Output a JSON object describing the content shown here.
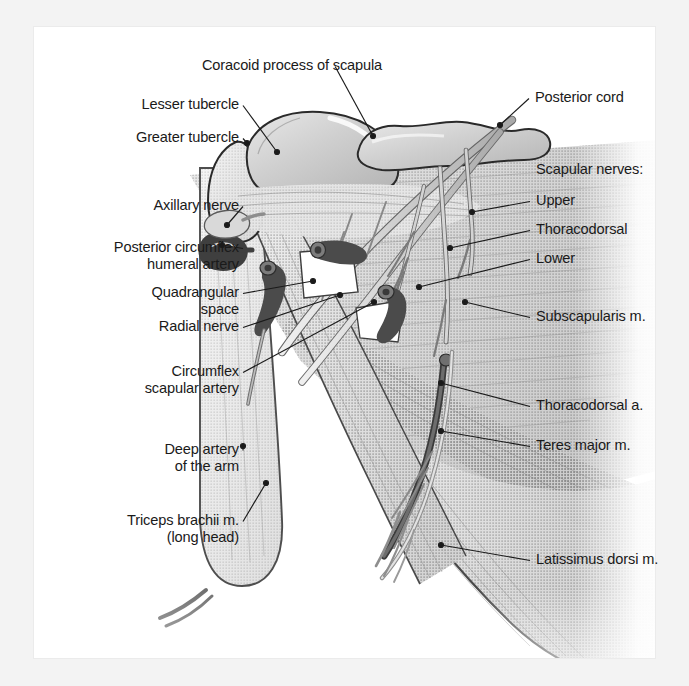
{
  "figure": {
    "background_color": "#f3f3f3",
    "page_color": "#ffffff",
    "ink_color": "#1a1a1a",
    "style": "grayscale halftone medical illustration"
  },
  "labels": [
    {
      "id": "coracoid-process",
      "text": "Coracoid process of scapula",
      "align": "c",
      "x": 194,
      "y": 57,
      "w": 196,
      "anchor_x": 373,
      "anchor_y": 136
    },
    {
      "id": "posterior-cord",
      "text": "Posterior cord",
      "align": "r",
      "x": 535,
      "y": 89,
      "w": 130,
      "anchor_x": 500,
      "anchor_y": 125
    },
    {
      "id": "lesser-tubercle",
      "text": "Lesser tubercle",
      "align": "l",
      "x": 125,
      "y": 96,
      "w": 114,
      "anchor_x": 277,
      "anchor_y": 152
    },
    {
      "id": "greater-tubercle",
      "text": "Greater tubercle",
      "align": "l",
      "x": 93,
      "y": 129,
      "w": 146,
      "anchor_x": 247,
      "anchor_y": 143
    },
    {
      "id": "scapular-nerves-heading",
      "text": "Scapular nerves:",
      "align": "r",
      "x": 536,
      "y": 161,
      "w": 140,
      "anchor_x": null,
      "anchor_y": null
    },
    {
      "id": "scapular-nerve-upper",
      "text": "Upper",
      "align": "r",
      "x": 536,
      "y": 192,
      "w": 70,
      "anchor_x": 472,
      "anchor_y": 212
    },
    {
      "id": "axillary-nerve",
      "text": "Axillary nerve",
      "align": "l",
      "x": 113,
      "y": 197,
      "w": 126,
      "anchor_x": 227,
      "anchor_y": 225
    },
    {
      "id": "thoracodorsal-nerve",
      "text": "Thoracodorsal",
      "align": "r",
      "x": 536,
      "y": 221,
      "w": 124,
      "anchor_x": 450,
      "anchor_y": 248
    },
    {
      "id": "posterior-circumflex",
      "text": "Posterior circumflex\nhumeral artery",
      "align": "l",
      "x": 51,
      "y": 239,
      "w": 188,
      "anchor_x": 222,
      "anchor_y": 245
    },
    {
      "id": "scapular-nerve-lower",
      "text": "Lower",
      "align": "r",
      "x": 536,
      "y": 250,
      "w": 70,
      "anchor_x": 419,
      "anchor_y": 287
    },
    {
      "id": "quadrangular-space",
      "text": "Quadrangular\nspace",
      "align": "l",
      "x": 79,
      "y": 284,
      "w": 160,
      "anchor_x": 313,
      "anchor_y": 281
    },
    {
      "id": "subscapularis-muscle",
      "text": "Subscapularis m.",
      "align": "r",
      "x": 536,
      "y": 308,
      "w": 150,
      "anchor_x": 465,
      "anchor_y": 302
    },
    {
      "id": "radial-nerve",
      "text": "Radial nerve",
      "align": "l",
      "x": 113,
      "y": 318,
      "w": 126,
      "anchor_x": 340,
      "anchor_y": 295
    },
    {
      "id": "circumflex-scapular",
      "text": "Circumflex\nscapular artery",
      "align": "l",
      "x": 79,
      "y": 363,
      "w": 160,
      "anchor_x": 374,
      "anchor_y": 302
    },
    {
      "id": "thoracodorsal-artery",
      "text": "Thoracodorsal a.",
      "align": "r",
      "x": 536,
      "y": 397,
      "w": 150,
      "anchor_x": 441,
      "anchor_y": 383
    },
    {
      "id": "teres-major-muscle",
      "text": "Teres major m.",
      "align": "r",
      "x": 536,
      "y": 437,
      "w": 140,
      "anchor_x": 441,
      "anchor_y": 431
    },
    {
      "id": "deep-artery-of-arm",
      "text": "Deep artery\nof the arm",
      "align": "l",
      "x": 79,
      "y": 441,
      "w": 160,
      "anchor_x": 243,
      "anchor_y": 446
    },
    {
      "id": "triceps-brachii-long-head",
      "text": "Triceps brachii m.\n(long head)",
      "align": "l",
      "x": 51,
      "y": 512,
      "w": 188,
      "anchor_x": 266,
      "anchor_y": 483
    },
    {
      "id": "latissimus-dorsi-muscle",
      "text": "Latissimus dorsi m.",
      "align": "r",
      "x": 536,
      "y": 551,
      "w": 170,
      "anchor_x": 441,
      "anchor_y": 545
    }
  ],
  "structures": [
    {
      "id": "humerus-head",
      "name": "Head of humerus"
    },
    {
      "id": "greater-tubercle-bone",
      "name": "Greater tubercle of humerus"
    },
    {
      "id": "lesser-tubercle-bone",
      "name": "Lesser tubercle of humerus"
    },
    {
      "id": "coracoid-process-bone",
      "name": "Coracoid process"
    },
    {
      "id": "subscapularis-belly",
      "name": "Subscapularis muscle belly"
    },
    {
      "id": "teres-major-belly",
      "name": "Teres major muscle belly"
    },
    {
      "id": "latissimus-dorsi-belly",
      "name": "Latissimus dorsi muscle belly"
    },
    {
      "id": "triceps-long-head-belly",
      "name": "Triceps brachii long head"
    },
    {
      "id": "humerus-shaft",
      "name": "Shaft of humerus"
    },
    {
      "id": "quadrangular-space-gap",
      "name": "Quadrangular space"
    },
    {
      "id": "posterior-cord-nerve",
      "name": "Posterior cord of brachial plexus"
    },
    {
      "id": "axillary-nerve-branch",
      "name": "Axillary nerve"
    },
    {
      "id": "radial-nerve-branch",
      "name": "Radial nerve"
    },
    {
      "id": "upper-subscapular-nerve",
      "name": "Upper subscapular nerve"
    },
    {
      "id": "thoracodorsal-nerve-branch",
      "name": "Thoracodorsal nerve"
    },
    {
      "id": "lower-subscapular-nerve",
      "name": "Lower subscapular nerve"
    },
    {
      "id": "posterior-circumflex-artery",
      "name": "Posterior circumflex humeral artery"
    },
    {
      "id": "circumflex-scapular-artery",
      "name": "Circumflex scapular artery"
    },
    {
      "id": "thoracodorsal-artery-vessel",
      "name": "Thoracodorsal artery"
    },
    {
      "id": "deep-brachial-artery",
      "name": "Deep artery of the arm"
    }
  ]
}
